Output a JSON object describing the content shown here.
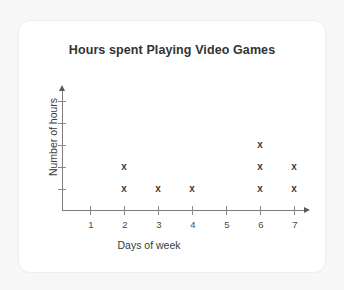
{
  "card": {
    "background": "#ffffff",
    "border_color": "#ededed"
  },
  "page": {
    "background": "#f7f7f7"
  },
  "chart_data": {
    "type": "scatter",
    "title": "Hours spent Playing Video Games",
    "xlabel": "Days of week",
    "ylabel": "Number of hours",
    "marker": "x",
    "marker_color": "#3c3c3c",
    "axis_color": "#7d7d7d",
    "grid": false,
    "legend": null,
    "x_tick_labels": [
      "1",
      "2",
      "3",
      "4",
      "5",
      "6",
      "7"
    ],
    "x": [
      1,
      2,
      3,
      4,
      5,
      6,
      7
    ],
    "y_tick_labels": [
      "",
      "",
      "",
      "",
      ""
    ],
    "y_tick_count": 5,
    "xlim": [
      0,
      7.6
    ],
    "ylim": [
      0,
      5
    ],
    "values": [
      0,
      2,
      1,
      1,
      0,
      3,
      2
    ],
    "categories": [
      "1",
      "2",
      "3",
      "4",
      "5",
      "6",
      "7"
    ],
    "points": [
      {
        "x": 2,
        "y": 1
      },
      {
        "x": 2,
        "y": 2
      },
      {
        "x": 3,
        "y": 1
      },
      {
        "x": 4,
        "y": 1
      },
      {
        "x": 6,
        "y": 1
      },
      {
        "x": 6,
        "y": 2
      },
      {
        "x": 6,
        "y": 3
      },
      {
        "x": 7,
        "y": 1
      },
      {
        "x": 7,
        "y": 2
      }
    ]
  }
}
